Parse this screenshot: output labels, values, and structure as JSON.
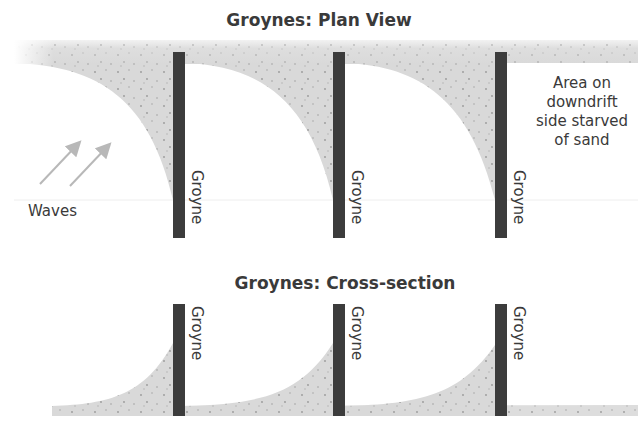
{
  "plan_view": {
    "title": "Groynes: Plan View",
    "groyne_label": "Groyne",
    "groynes": [
      {
        "label": "Groyne"
      },
      {
        "label": "Groyne"
      },
      {
        "label": "Groyne"
      }
    ],
    "waves_label": "Waves",
    "annotation": {
      "line1": "Area on",
      "line2": "downdrift",
      "line3": "side starved",
      "line4": "of sand"
    }
  },
  "cross_section": {
    "title": "Groynes: Cross-section",
    "groynes": [
      {
        "label": "Groyne"
      },
      {
        "label": "Groyne"
      },
      {
        "label": "Groyne"
      }
    ]
  },
  "colors": {
    "sand": "#d9d9d9",
    "groyne": "#3c3c3c",
    "text": "#3a3a3a",
    "arrow": "#b8b8b8",
    "grain": "#9a9a9a"
  }
}
